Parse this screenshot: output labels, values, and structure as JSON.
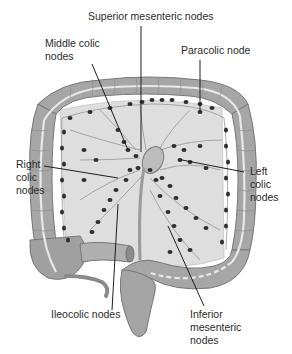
{
  "diagram": {
    "labels": {
      "superior_mesenteric": "Superior mesenteric nodes",
      "middle_colic_1": "Middle colic",
      "middle_colic_2": "nodes",
      "paracolic": "Paracolic node",
      "right_colic_1": "Right",
      "right_colic_2": "colic",
      "right_colic_3": "nodes",
      "left_colic_1": "Left",
      "left_colic_2": "colic",
      "left_colic_3": "nodes",
      "ileocolic": "Ileocolic nodes",
      "inferior_mesenteric_1": "Inferior",
      "inferior_mesenteric_2": "mesenteric",
      "inferior_mesenteric_3": "nodes"
    },
    "colors": {
      "colon_fill": "#a9a9a9",
      "colon_stroke": "#7a7a7a",
      "taenia": "#e6e6e6",
      "mesentery": "#dcdcdc",
      "node": "#2e2e2e",
      "leader_line": "#1e1e1e",
      "text": "#2b2b2b"
    }
  }
}
